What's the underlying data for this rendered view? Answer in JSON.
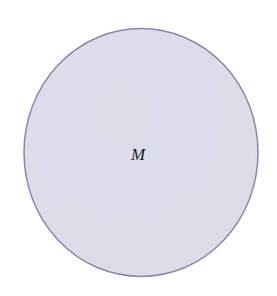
{
  "figure": {
    "kind": "geometric-set-diagram",
    "background_color": "#ffffff",
    "width": 277,
    "height": 296,
    "caption": ""
  },
  "region": {
    "name": "manifold-region",
    "label": "M",
    "shape": "circle",
    "fill_color": "#dfdfed",
    "stroke_color": "#8888ae",
    "stroke_width": 1.5,
    "center_x": 141,
    "center_y": 152.5,
    "radius_x": 117,
    "radius_y": 124,
    "label_x": 138,
    "label_y": 155
  },
  "palette": {
    "page_background": "#ffffff",
    "region_fill": "#dfdfed",
    "region_stroke": "#8888ae",
    "label_text": "#1a1a22",
    "texture_light": "#e6e6f2",
    "texture_dark": "#d6d6e6"
  }
}
